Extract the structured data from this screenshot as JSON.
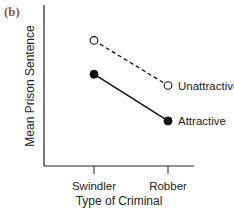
{
  "panel_label": "(b)",
  "colors": {
    "panel_label": "#8a5a4a",
    "axis": "#222222",
    "series": "#111111"
  },
  "chart_data": {
    "type": "line",
    "title": "",
    "xlabel": "Type of Criminal",
    "ylabel": "Mean Prison Sentence",
    "categories": [
      "Swindler",
      "Robber"
    ],
    "series": [
      {
        "name": "Unattractive",
        "values": [
          7.8,
          5.0
        ],
        "line_style": "dashed",
        "marker": "open-circle"
      },
      {
        "name": "Attractive",
        "values": [
          5.7,
          2.8
        ],
        "line_style": "solid",
        "marker": "filled-circle"
      }
    ],
    "ylim": [
      0,
      10
    ],
    "y_ticks": false,
    "grid": false,
    "legend_position": "inline-right"
  }
}
